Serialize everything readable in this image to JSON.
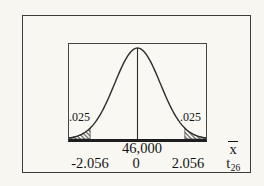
{
  "colors": {
    "background": "#f7f6f1",
    "curve_line": "#2e2e2e",
    "axis_line": "#1e1e1e",
    "hatch": "#333333",
    "text": "#141414"
  },
  "chart_data": {
    "type": "area",
    "curve_shape": "symmetric bell curve (t distribution, 26 degrees of freedom)",
    "title": "",
    "x_axes": [
      {
        "symbol": "x̄",
        "ticks": [
          "46,000"
        ]
      },
      {
        "symbol": "t26",
        "ticks": [
          "-2.056",
          "0",
          "2.056"
        ]
      }
    ],
    "critical_values": [
      -2.056,
      2.056
    ],
    "tail_areas": [
      0.025,
      0.025
    ],
    "shaded_regions": [
      "left tail beyond -2.056",
      "right tail beyond 2.056"
    ],
    "center_line_at": {
      "t": 0,
      "xbar": "46,000"
    },
    "legend": "off",
    "grid": "off"
  },
  "labels": {
    "left_tail_area": ".025",
    "right_tail_area": ".025",
    "center_xbar": "46,000",
    "tick_neg": "-2.056",
    "tick_zero": "0",
    "tick_pos": "2.056",
    "xbar_symbol": "x",
    "t_symbol_base": "t",
    "t_symbol_sub": "26"
  }
}
